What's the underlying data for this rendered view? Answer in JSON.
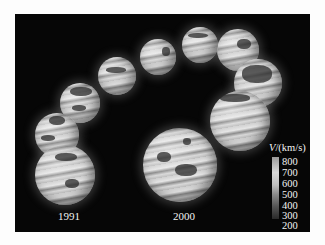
{
  "figure": {
    "year_labels": {
      "start": "1991",
      "end": "2000"
    },
    "colorbar": {
      "variable": "V",
      "unit": "/(km/s)",
      "ticks": [
        "800",
        "700",
        "600",
        "500",
        "400",
        "300",
        "200"
      ]
    }
  }
}
